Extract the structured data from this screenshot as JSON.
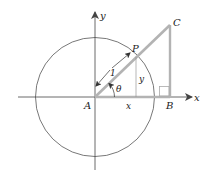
{
  "diagram": {
    "type": "geometry",
    "labels": {
      "x_axis": "x",
      "y_axis": "y",
      "origin": "A",
      "point_P": "P",
      "point_B": "B",
      "point_C": "C",
      "radius": "1",
      "angle": "θ",
      "horizontal_leg": "x",
      "vertical_leg": "y"
    },
    "colors": {
      "axes": "#444444",
      "circle": "#555555",
      "triangle": "#b3b3b3",
      "text": "#222222"
    }
  }
}
